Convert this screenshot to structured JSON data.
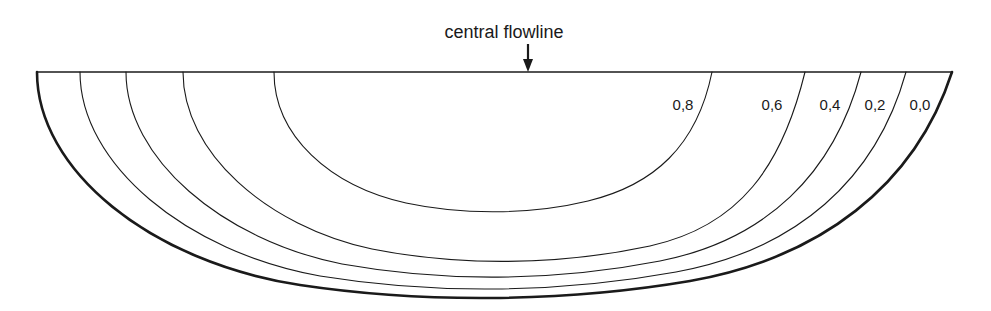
{
  "figure": {
    "background_color": "#ffffff",
    "line_color": "#1a1a1a",
    "width": 991,
    "height": 311
  },
  "annotation": {
    "title": "central flowline",
    "title_x": 504,
    "title_y": 38,
    "arrow_name": "down-arrow-icon",
    "arrow_x": 528,
    "arrow_top_y": 44,
    "arrow_bottom_y": 72
  },
  "surface_line": {
    "name": "ice-surface-line",
    "x1": 37,
    "y1": 72,
    "x2": 952,
    "y2": 72
  },
  "chart_data": {
    "type": "line",
    "title": "central flowline",
    "xlabel": "",
    "ylabel": "",
    "grid": false,
    "legend": "none",
    "contour_label_values": [
      "0,8",
      "0,6",
      "0,4",
      "0,2",
      "0,0"
    ],
    "contours": [
      {
        "label": "0,0",
        "outer_boundary": true,
        "stroke_width": 2.6,
        "left_anchor_x": 37,
        "right_anchor_x": 952,
        "bottom_y": 297,
        "label_x": 920,
        "label_y": 110,
        "path": "M 37,72 C 37,170 150,262 300,285 C 420,303 560,303 690,281 C 820,258 915,186 952,72"
      },
      {
        "label": "0,2",
        "outer_boundary": false,
        "stroke_width": 1.1,
        "left_anchor_x": 80,
        "right_anchor_x": 906,
        "bottom_y": 288,
        "label_x": 875,
        "label_y": 110,
        "path": "M 80,72 C 80,164 186,252 320,276 C 430,294 555,294 676,272 C 796,250 876,180 906,72"
      },
      {
        "label": "0,4",
        "outer_boundary": false,
        "stroke_width": 1.1,
        "left_anchor_x": 126,
        "right_anchor_x": 861,
        "bottom_y": 277,
        "label_x": 830,
        "label_y": 110,
        "path": "M 126,72 C 126,158 222,240 342,264 C 442,282 552,282 660,261 C 766,240 834,174 861,72"
      },
      {
        "label": "0,6",
        "outer_boundary": false,
        "stroke_width": 1.1,
        "left_anchor_x": 183,
        "right_anchor_x": 805,
        "bottom_y": 261,
        "label_x": 772,
        "label_y": 110,
        "path": "M 183,72 C 183,152 266,226 372,249 C 458,266 556,266 650,246 C 740,226 782,166 805,72"
      },
      {
        "label": "0,8",
        "outer_boundary": false,
        "stroke_width": 1.1,
        "left_anchor_x": 274,
        "right_anchor_x": 712,
        "bottom_y": 214,
        "label_x": 683,
        "label_y": 110,
        "path": "M 274,72 C 274,136 330,186 406,203 C 462,215 530,215 588,201 C 654,185 697,146 712,72"
      }
    ]
  }
}
